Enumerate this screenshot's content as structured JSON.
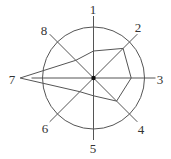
{
  "diagram": {
    "type": "radar",
    "center": [
      93.5,
      78
    ],
    "circle_radius": 51,
    "axis_length": 62,
    "line_color": "#555555",
    "center_dot_color": "#111111",
    "axes": [
      {
        "label": "1",
        "angle_deg": -90,
        "value": 0.53
      },
      {
        "label": "2",
        "angle_deg": -45,
        "value": 0.82
      },
      {
        "label": "3",
        "angle_deg": 0,
        "value": 0.74
      },
      {
        "label": "4",
        "angle_deg": 45,
        "value": 0.64
      },
      {
        "label": "5",
        "angle_deg": 90,
        "value": 0.35
      },
      {
        "label": "6",
        "angle_deg": 135,
        "value": 0.38
      },
      {
        "label": "7",
        "angle_deg": 180,
        "value": 1.44
      },
      {
        "label": "8",
        "angle_deg": 225,
        "value": 0.49
      }
    ],
    "label_positions": [
      [
        93,
        14
      ],
      [
        138,
        32
      ],
      [
        160,
        84
      ],
      [
        141,
        134
      ],
      [
        93,
        153
      ],
      [
        45,
        133
      ],
      [
        12,
        84
      ],
      [
        44,
        35
      ]
    ]
  }
}
